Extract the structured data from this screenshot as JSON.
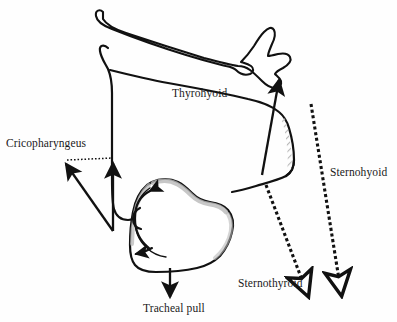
{
  "figure": {
    "background_color": "#fefefe",
    "ink_color": "#111111",
    "shade_color": "#b9b9b9",
    "width": 397,
    "height": 322
  },
  "labels": {
    "thyrohyoid": "Thyrohyoid",
    "cricopharyngeus": "Cricopharyngeus",
    "sternohyoid": "Sternohyoid",
    "sternothyroid": "Sternothyroid",
    "tracheal_pull": "Tracheal pull"
  },
  "structures": [
    {
      "name": "hyoid-bone",
      "style": "outline",
      "description": "Hyoid bone outline at top of figure"
    },
    {
      "name": "thyroid-cartilage",
      "style": "outline",
      "description": "Thyroid cartilage body with superior horn"
    },
    {
      "name": "cricoid-cartilage",
      "style": "outline-shaded",
      "description": "Cricoid cartilage with hatched shading"
    },
    {
      "name": "cricothyroid-shading",
      "style": "hatched",
      "description": "Gray hatched band along cartilage margin"
    }
  ],
  "arrows": [
    {
      "name": "thyrohyoid-arrow",
      "style": "solid",
      "direction": "up",
      "head": "filled"
    },
    {
      "name": "cricopharyngeus-arrow-diagonal",
      "style": "solid",
      "direction": "up-left",
      "head": "filled"
    },
    {
      "name": "cricopharyngeus-arrow-vertical",
      "style": "solid",
      "direction": "up",
      "head": "filled"
    },
    {
      "name": "cricopharyngeus-connector",
      "style": "dotted",
      "direction": "horizontal",
      "head": "none"
    },
    {
      "name": "sternohyoid-arrow",
      "style": "dashed",
      "direction": "down",
      "head": "hollow"
    },
    {
      "name": "sternothyroid-arrow",
      "style": "dashed",
      "direction": "down",
      "head": "hollow"
    },
    {
      "name": "tracheal-pull-arrow",
      "style": "solid",
      "direction": "down",
      "head": "filled"
    },
    {
      "name": "cricoid-rotation-arrow",
      "style": "solid-curved",
      "direction": "counterclockwise",
      "head": "filled-both"
    }
  ]
}
